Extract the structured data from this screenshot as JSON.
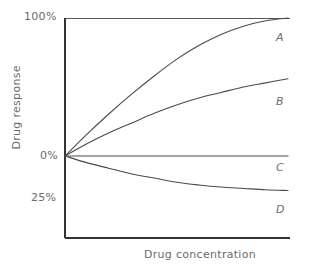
{
  "chart_data": {
    "type": "line",
    "title": "",
    "xlabel": "Drug concentration",
    "ylabel": "Drug response",
    "xlim": [
      0,
      100
    ],
    "ylim": [
      -35,
      100
    ],
    "grid": false,
    "legend_position": "right-of-curve-ends",
    "x_tick_labels": [],
    "y_tick_labels": [
      "100%",
      "0%",
      "25%"
    ],
    "y_tick_values": [
      100,
      0,
      -25
    ],
    "reference_lines": [
      {
        "name": "ceiling-100",
        "value": 100,
        "orientation": "horizontal"
      }
    ],
    "axis_colors": {
      "axis": "#333333",
      "curve": "#4a4a4a",
      "text": "#6b6b6b",
      "background": "#ffffff"
    },
    "x": [
      0,
      10,
      20,
      30,
      40,
      50,
      60,
      70,
      80,
      90,
      100
    ],
    "series": [
      {
        "name": "A",
        "label": "A",
        "values": [
          0,
          16,
          31,
          45,
          58,
          70,
          80,
          88,
          94,
          98,
          100
        ]
      },
      {
        "name": "B",
        "label": "B",
        "values": [
          0,
          9,
          17,
          24,
          31,
          37,
          42,
          46,
          50,
          53,
          56
        ]
      },
      {
        "name": "C",
        "label": "C",
        "values": [
          0,
          0,
          0,
          0,
          0,
          0,
          0,
          0,
          0,
          0,
          0
        ]
      },
      {
        "name": "D",
        "label": "D",
        "values": [
          0,
          -5,
          -9,
          -13,
          -16,
          -19,
          -21,
          -22.5,
          -23.5,
          -24.5,
          -25
        ]
      }
    ]
  },
  "labels": {
    "ytick_100": "100%",
    "ytick_0": "0%",
    "ytick_25": "25%",
    "curve_a": "A",
    "curve_b": "B",
    "curve_c": "C",
    "curve_d": "D",
    "xaxis_title": "Drug concentration",
    "yaxis_title": "Drug response"
  }
}
